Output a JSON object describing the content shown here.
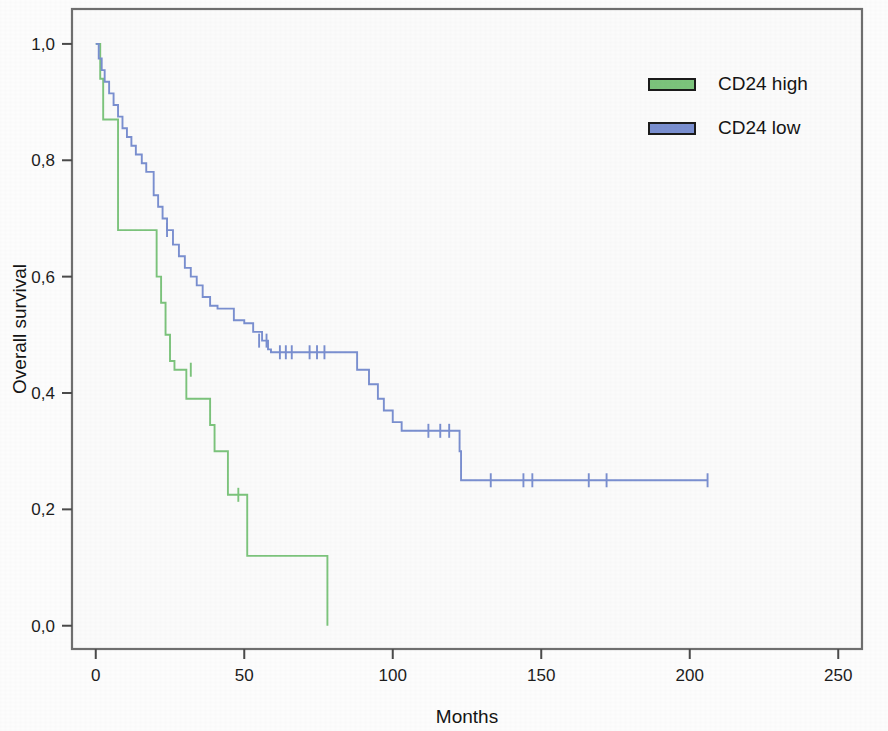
{
  "figure": {
    "background_color": "#fdfdfd",
    "plot_frame_color": "#6f6f6f",
    "plot_area_fill": "#fbfbfb"
  },
  "axes": {
    "x": {
      "title": "Months",
      "ticks": [
        "0",
        "50",
        "100",
        "150",
        "200",
        "250"
      ],
      "tick_values": [
        0,
        50,
        100,
        150,
        200,
        250
      ],
      "min": -8,
      "max": 258
    },
    "y": {
      "title": "Overall survival",
      "ticks": [
        "0,0",
        "0,2",
        "0,4",
        "0,6",
        "0,8",
        "1,0"
      ],
      "tick_values": [
        0.0,
        0.2,
        0.4,
        0.6,
        0.8,
        1.0
      ],
      "min": -0.04,
      "max": 1.06
    }
  },
  "legend": {
    "position": "top-right",
    "items": [
      {
        "label": "CD24 high",
        "color": "#7cc47c"
      },
      {
        "label": "CD24 low",
        "color": "#7a8fd0"
      }
    ]
  },
  "chart_data": {
    "type": "line",
    "subtype": "kaplan-meier-survival",
    "title": "",
    "xlabel": "Months",
    "ylabel": "Overall survival",
    "xlim": [
      -8,
      258
    ],
    "ylim": [
      -0.04,
      1.06
    ],
    "grid": false,
    "legend_position": "top-right",
    "series": [
      {
        "name": "CD24 high",
        "color": "#7cc47c",
        "steps": [
          [
            0,
            1.0
          ],
          [
            1.5,
            0.94
          ],
          [
            2.5,
            0.87
          ],
          [
            7.0,
            0.87
          ],
          [
            7.5,
            0.68
          ],
          [
            20.0,
            0.68
          ],
          [
            20.5,
            0.6
          ],
          [
            22.0,
            0.555
          ],
          [
            23.5,
            0.5
          ],
          [
            25.0,
            0.455
          ],
          [
            26.5,
            0.44
          ],
          [
            30.0,
            0.44
          ],
          [
            30.5,
            0.39
          ],
          [
            38.0,
            0.39
          ],
          [
            38.5,
            0.345
          ],
          [
            40.0,
            0.3
          ],
          [
            44.0,
            0.3
          ],
          [
            44.5,
            0.225
          ],
          [
            50.5,
            0.225
          ],
          [
            51.0,
            0.12
          ],
          [
            78.0,
            0.12
          ],
          [
            78.0,
            0.0
          ]
        ],
        "censor_marks": [
          [
            32.0,
            0.44
          ],
          [
            48.0,
            0.225
          ]
        ]
      },
      {
        "name": "CD24 low",
        "color": "#7a8fd0",
        "steps": [
          [
            0,
            1.0
          ],
          [
            1.0,
            0.975
          ],
          [
            2.0,
            0.955
          ],
          [
            3.0,
            0.935
          ],
          [
            4.5,
            0.915
          ],
          [
            6.0,
            0.895
          ],
          [
            7.5,
            0.875
          ],
          [
            9.0,
            0.855
          ],
          [
            10.5,
            0.84
          ],
          [
            12.0,
            0.825
          ],
          [
            13.5,
            0.81
          ],
          [
            15.5,
            0.795
          ],
          [
            17.0,
            0.78
          ],
          [
            19.0,
            0.78
          ],
          [
            19.5,
            0.74
          ],
          [
            21.0,
            0.72
          ],
          [
            22.5,
            0.7
          ],
          [
            24.0,
            0.68
          ],
          [
            26.0,
            0.655
          ],
          [
            28.0,
            0.635
          ],
          [
            30.0,
            0.615
          ],
          [
            32.0,
            0.6
          ],
          [
            34.0,
            0.585
          ],
          [
            36.0,
            0.565
          ],
          [
            38.5,
            0.55
          ],
          [
            41.0,
            0.545
          ],
          [
            46.0,
            0.545
          ],
          [
            46.5,
            0.525
          ],
          [
            50.0,
            0.52
          ],
          [
            53.0,
            0.505
          ],
          [
            56.0,
            0.49
          ],
          [
            58.0,
            0.475
          ],
          [
            59.0,
            0.47
          ],
          [
            87.0,
            0.47
          ],
          [
            88.0,
            0.44
          ],
          [
            92.0,
            0.415
          ],
          [
            95.0,
            0.39
          ],
          [
            97.0,
            0.37
          ],
          [
            100.0,
            0.35
          ],
          [
            103.0,
            0.335
          ],
          [
            122.0,
            0.335
          ],
          [
            122.5,
            0.3
          ],
          [
            123.0,
            0.25
          ],
          [
            206.0,
            0.25
          ]
        ],
        "censor_marks": [
          [
            24.0,
            0.68
          ],
          [
            55.0,
            0.49
          ],
          [
            57.5,
            0.49
          ],
          [
            62.0,
            0.47
          ],
          [
            64.0,
            0.47
          ],
          [
            66.0,
            0.47
          ],
          [
            72.0,
            0.47
          ],
          [
            74.5,
            0.47
          ],
          [
            77.0,
            0.47
          ],
          [
            112.0,
            0.335
          ],
          [
            116.0,
            0.335
          ],
          [
            119.0,
            0.335
          ],
          [
            133.0,
            0.25
          ],
          [
            144.0,
            0.25
          ],
          [
            147.0,
            0.25
          ],
          [
            166.0,
            0.25
          ],
          [
            172.0,
            0.25
          ],
          [
            206.0,
            0.25
          ]
        ]
      }
    ]
  }
}
